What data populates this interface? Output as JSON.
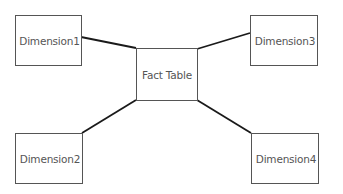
{
  "diagram": {
    "type": "star-schema",
    "fact": {
      "label": "Fact Table"
    },
    "dimensions": [
      {
        "id": "dim1",
        "label": "Dimension1"
      },
      {
        "id": "dim2",
        "label": "Dimension2"
      },
      {
        "id": "dim3",
        "label": "Dimension3"
      },
      {
        "id": "dim4",
        "label": "Dimension4"
      }
    ],
    "edges": [
      {
        "from": "dim1",
        "to": "fact"
      },
      {
        "from": "fact",
        "to": "dim3"
      },
      {
        "from": "fact",
        "to": "dim2"
      },
      {
        "from": "fact",
        "to": "dim4"
      }
    ],
    "colors": {
      "line": "#1a1a1a",
      "border": "#555555",
      "text": "#555555"
    }
  }
}
